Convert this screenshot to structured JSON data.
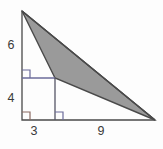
{
  "figure": {
    "name": "right-triangle-with-inscribed-square",
    "background_color": "#fdfdfd",
    "outline_color": "#4a4a4a",
    "shade_fill_color": "#9a9a9a",
    "shade_stroke_color": "#4a4a4a",
    "inner_line_color": "#6b6b9a",
    "square_line_color": "#555566",
    "right_angle_mark_color": "#6b6b9a",
    "right_angle_mark_color_alt": "#8a6a62",
    "label_color": "#3a3a3a"
  },
  "labels": {
    "left_upper": "6",
    "left_lower": "4",
    "bottom_left": "3",
    "bottom_right": "9"
  },
  "geometry": {
    "apex": {
      "x": 22,
      "y": 11
    },
    "bottom_left_corner": {
      "x": 22,
      "y": 120
    },
    "bottom_right_corner": {
      "x": 155,
      "y": 120
    },
    "square_top_left": {
      "x": 22,
      "y": 78
    },
    "square_top_right": {
      "x": 55,
      "y": 78
    },
    "square_bottom_right": {
      "x": 55,
      "y": 120
    },
    "shaded_triangle_points": "22,11 55,78 155,120"
  },
  "dimensions": {
    "vertical_upper_segment": "6",
    "vertical_lower_segment": "4",
    "horizontal_left_segment": "3",
    "horizontal_right_segment": "9"
  },
  "right_angle_marks": [
    {
      "name": "right-angle-mark-upper-left",
      "x": 22,
      "y": 78,
      "size": 8
    },
    {
      "name": "right-angle-mark-bottom-left",
      "x": 22,
      "y": 120,
      "size": 8
    },
    {
      "name": "right-angle-mark-bottom-inner",
      "x": 55,
      "y": 120,
      "size": 8
    }
  ]
}
